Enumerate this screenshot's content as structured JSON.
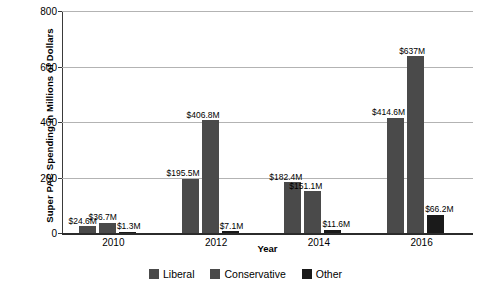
{
  "chart_data": {
    "type": "bar",
    "title": "",
    "xlabel": "Year",
    "ylabel": "Super PAC Spending in Millions of Dollars",
    "categories": [
      "2010",
      "2012",
      "2014",
      "2016"
    ],
    "ylim": [
      0,
      800
    ],
    "yticks": [
      0,
      200,
      400,
      600,
      800
    ],
    "ytick_labels": [
      "0",
      "200",
      "400",
      "600",
      "800"
    ],
    "grid": "horizontal",
    "legend_position": "bottom-center",
    "series": [
      {
        "name": "Liberal",
        "color": "#4a4a4a",
        "values": [
          24.6,
          195.5,
          182.4,
          414.6
        ],
        "labels": [
          "$24.6M",
          "$195.5M",
          "$182.4M",
          "$414.6M"
        ]
      },
      {
        "name": "Conservative",
        "color": "#4a4a4a",
        "values": [
          36.7,
          406.8,
          151.1,
          637.0
        ],
        "labels": [
          "$36.7M",
          "$406.8M",
          "$151.1M",
          "$637M"
        ]
      },
      {
        "name": "Other",
        "color": "#1a1a1a",
        "values": [
          1.3,
          7.1,
          11.6,
          66.2
        ],
        "labels": [
          "$1.3M",
          "$7.1M",
          "$11.6M",
          "$66.2M"
        ]
      }
    ]
  },
  "colors": {
    "liberal": "#4a4a4a",
    "conservative": "#4a4a4a",
    "other": "#1a1a1a",
    "gridline": "#b3b3b3",
    "axis": "#2b2b2b",
    "background": "#ffffff"
  },
  "axes": {
    "y_title": "Super PAC Spending in Millions of Dollars",
    "x_title": "Year",
    "y_tick_0": "0",
    "y_tick_1": "200",
    "y_tick_2": "400",
    "y_tick_3": "600",
    "y_tick_4": "800",
    "x_tick_0": "2010",
    "x_tick_1": "2012",
    "x_tick_2": "2014",
    "x_tick_3": "2016"
  },
  "legend": {
    "items": [
      {
        "label": "Liberal",
        "color": "#4a4a4a"
      },
      {
        "label": "Conservative",
        "color": "#4a4a4a"
      },
      {
        "label": "Other",
        "color": "#1a1a1a"
      }
    ]
  },
  "labels": {
    "g0s0": "$24.6M",
    "g0s1": "$36.7M",
    "g0s2": "$1.3M",
    "g1s0": "$195.5M",
    "g1s1": "$406.8M",
    "g1s2": "$7.1M",
    "g2s0": "$182.4M",
    "g2s1": "$151.1M",
    "g2s2": "$11.6M",
    "g3s0": "$414.6M",
    "g3s1": "$637M",
    "g3s2": "$66.2M"
  }
}
